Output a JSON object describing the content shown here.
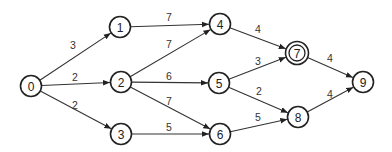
{
  "diagram": {
    "type": "directed-weighted-graph",
    "nodes": [
      {
        "id": "0",
        "label": "0",
        "x": 31,
        "y": 86,
        "double": false
      },
      {
        "id": "1",
        "label": "1",
        "x": 120,
        "y": 27,
        "double": false
      },
      {
        "id": "2",
        "label": "2",
        "x": 121,
        "y": 82,
        "double": false
      },
      {
        "id": "3",
        "label": "3",
        "x": 121,
        "y": 134,
        "double": false
      },
      {
        "id": "4",
        "label": "4",
        "x": 220,
        "y": 24,
        "double": false
      },
      {
        "id": "5",
        "label": "5",
        "x": 219,
        "y": 83,
        "double": false
      },
      {
        "id": "6",
        "label": "6",
        "x": 220,
        "y": 134,
        "double": false
      },
      {
        "id": "7",
        "label": "7",
        "x": 297,
        "y": 53,
        "double": true
      },
      {
        "id": "8",
        "label": "8",
        "x": 298,
        "y": 117,
        "double": false
      },
      {
        "id": "9",
        "label": "9",
        "x": 363,
        "y": 82,
        "double": false
      }
    ],
    "edges": [
      {
        "from": "0",
        "to": "1",
        "weight": "3",
        "lx": 73,
        "ly": 45
      },
      {
        "from": "0",
        "to": "2",
        "weight": "2",
        "lx": 75,
        "ly": 77
      },
      {
        "from": "0",
        "to": "3",
        "weight": "2",
        "lx": 75,
        "ly": 105
      },
      {
        "from": "1",
        "to": "4",
        "weight": "7",
        "lx": 169,
        "ly": 17
      },
      {
        "from": "2",
        "to": "4",
        "weight": "7",
        "lx": 169,
        "ly": 44
      },
      {
        "from": "2",
        "to": "5",
        "weight": "6",
        "lx": 169,
        "ly": 76
      },
      {
        "from": "2",
        "to": "6",
        "weight": "7",
        "lx": 169,
        "ly": 101
      },
      {
        "from": "3",
        "to": "6",
        "weight": "5",
        "lx": 169,
        "ly": 127
      },
      {
        "from": "4",
        "to": "7",
        "weight": "4",
        "lx": 258,
        "ly": 29
      },
      {
        "from": "5",
        "to": "7",
        "weight": "3",
        "lx": 258,
        "ly": 61
      },
      {
        "from": "5",
        "to": "8",
        "weight": "2",
        "lx": 259,
        "ly": 91
      },
      {
        "from": "6",
        "to": "8",
        "weight": "5",
        "lx": 258,
        "ly": 117
      },
      {
        "from": "7",
        "to": "9",
        "weight": "4",
        "lx": 330,
        "ly": 58
      },
      {
        "from": "8",
        "to": "9",
        "weight": "4",
        "lx": 330,
        "ly": 94
      }
    ],
    "colors": {
      "stroke": "#222222",
      "background": "#ffffff"
    }
  }
}
